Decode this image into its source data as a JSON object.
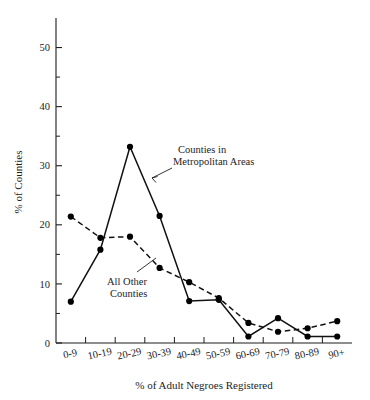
{
  "chart_data": {
    "type": "line",
    "title": "",
    "xlabel": "% of Adult Negroes Registered",
    "ylabel": "% of Counties",
    "categories": [
      "0-9",
      "10-19",
      "20-29",
      "30-39",
      "40-49",
      "50-59",
      "60-69",
      "70-79",
      "80-89",
      "90+"
    ],
    "ylim": [
      0,
      55
    ],
    "yticks": [
      0,
      10,
      20,
      30,
      40,
      50
    ],
    "ytick_labels": [
      "0",
      "10",
      "20",
      "30",
      "40",
      "50"
    ],
    "minor_yticks": [
      5,
      15,
      25,
      35,
      45
    ],
    "grid": false,
    "legend_position": "inline-annotations",
    "series": [
      {
        "name": "Counties in Metropolitan Areas",
        "style": "solid",
        "marker": "filled-circle",
        "values": [
          7.0,
          15.8,
          33.2,
          21.5,
          7.1,
          7.3,
          1.1,
          4.2,
          1.1,
          1.1
        ]
      },
      {
        "name": "All Other Counties",
        "style": "dashed",
        "marker": "filled-circle",
        "values": [
          21.4,
          17.8,
          18.0,
          12.7,
          10.3,
          7.6,
          3.4,
          1.9,
          2.5,
          3.7
        ]
      }
    ],
    "annotations": [
      {
        "id": "metro-label",
        "text_line1": "Counties in",
        "text_line2": "Metropolitan Areas",
        "points_to_series": "Counties in Metropolitan Areas"
      },
      {
        "id": "other-label",
        "text_line1": "All Other",
        "text_line2": "Counties",
        "points_to_series": "All Other Counties"
      }
    ],
    "colors": {
      "axis": "#1d1d1d",
      "series_solid": "#111111",
      "series_dashed": "#111111",
      "marker": "#000000",
      "background": "#ffffff"
    }
  }
}
